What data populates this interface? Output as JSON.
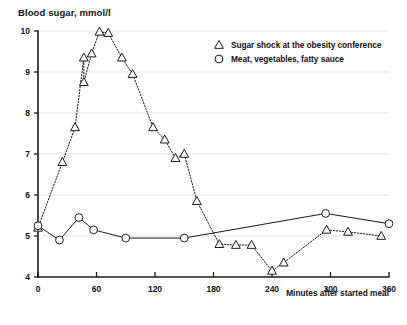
{
  "chart_data": {
    "type": "line",
    "title": "Blood sugar, mmol/l",
    "ylabel": "Blood sugar, mmol/l",
    "xlabel": "Minutes after started meal",
    "xlim": [
      0,
      360
    ],
    "ylim": [
      4,
      10
    ],
    "xticks": [
      0,
      60,
      120,
      180,
      240,
      300,
      360
    ],
    "xtick_labels": [
      "0",
      "60",
      "120",
      "180",
      "240",
      "300",
      "360"
    ],
    "yticks": [
      4,
      5,
      6,
      7,
      8,
      9,
      10
    ],
    "ytick_labels": [
      "4",
      "5",
      "6",
      "7",
      "8",
      "9",
      "10"
    ],
    "grid": true,
    "legend_position": "top-right",
    "series": [
      {
        "name": "Sugar shock at the obesity conference",
        "marker": "triangle",
        "linestyle": "dotted",
        "points": [
          [
            0,
            5.2
          ],
          [
            25,
            6.8
          ],
          [
            38,
            7.65
          ],
          [
            47,
            9.35
          ],
          [
            47,
            8.75
          ],
          [
            55,
            9.45
          ],
          [
            63,
            9.98
          ],
          [
            72,
            9.95
          ],
          [
            86,
            9.35
          ],
          [
            97,
            8.95
          ],
          [
            118,
            7.65
          ],
          [
            130,
            7.35
          ],
          [
            141,
            6.9
          ],
          [
            150,
            7.0
          ],
          [
            163,
            5.85
          ],
          [
            186,
            4.8
          ],
          [
            203,
            4.78
          ],
          [
            219,
            4.78
          ],
          [
            240,
            4.15
          ],
          [
            252,
            4.35
          ],
          [
            296,
            5.15
          ],
          [
            318,
            5.1
          ],
          [
            352,
            5.0
          ]
        ]
      },
      {
        "name": "Meat, vegetables, fatty sauce",
        "marker": "circle",
        "linestyle": "solid",
        "points": [
          [
            0,
            5.25
          ],
          [
            22,
            4.9
          ],
          [
            42,
            5.45
          ],
          [
            57,
            5.15
          ],
          [
            90,
            4.95
          ],
          [
            150,
            4.95
          ],
          [
            295,
            5.55
          ],
          [
            360,
            5.3
          ]
        ]
      }
    ]
  },
  "legend": {
    "items": [
      {
        "marker": "triangle",
        "label": "Sugar shock at the obesity conference"
      },
      {
        "marker": "circle",
        "label": "Meat, vegetables, fatty sauce"
      }
    ]
  }
}
